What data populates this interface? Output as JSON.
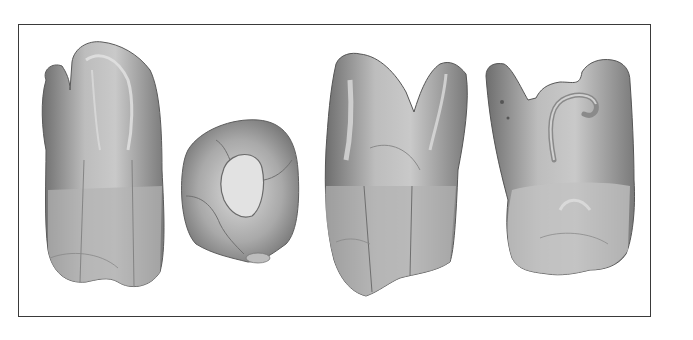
{
  "figure": {
    "panels": [
      {
        "view": "buccal-view"
      },
      {
        "view": "occlusal-view"
      },
      {
        "view": "mesial-view"
      },
      {
        "view": "palatal-view"
      }
    ],
    "colors": {
      "background": "#ffffff",
      "frame": "#3a3a3a",
      "tooth_dark": "#6e6e6e",
      "tooth_mid": "#a8a8a8",
      "tooth_light": "#d8d8d8"
    }
  }
}
